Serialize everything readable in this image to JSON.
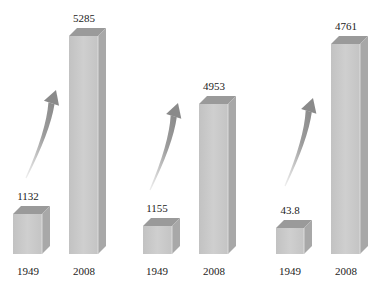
{
  "chart_data": {
    "type": "bar",
    "style": "3d-grouped-columns-with-growth-arrows",
    "title": "",
    "xlabel": "",
    "ylabel": "",
    "grid": false,
    "legend": null,
    "categories": [
      "1949",
      "2008"
    ],
    "groups": [
      {
        "name": "group-1",
        "values": [
          1132,
          5285
        ]
      },
      {
        "name": "group-2",
        "values": [
          1155,
          4953
        ]
      },
      {
        "name": "group-3",
        "values": [
          43.8,
          4761
        ]
      }
    ],
    "value_labels": [
      [
        "1132",
        "5285"
      ],
      [
        "1155",
        "4953"
      ],
      [
        "43.8",
        "4761"
      ]
    ],
    "x_labels": [
      [
        "1949",
        "2008"
      ],
      [
        "1949",
        "2008"
      ],
      [
        "1949",
        "2008"
      ]
    ],
    "annotations": [
      "upward growth arrow between 1949 and 2008 bars in each group"
    ]
  },
  "colors": {
    "front": "#c8c8c8",
    "top": "#9a9a9a",
    "side": "#a8a8a8",
    "arrow": "#8a8a8a"
  },
  "geometry": {
    "baseline_y": 254,
    "groups": [
      {
        "small": {
          "x": 13,
          "w": 29,
          "top": 214
        },
        "tall": {
          "x": 69,
          "w": 29,
          "top": 36
        },
        "arrow": [
          [
            26,
            178
          ],
          [
            56,
            90
          ]
        ],
        "small_label_x": 28,
        "tall_label_x": 84
      },
      {
        "small": {
          "x": 143,
          "w": 29,
          "top": 226
        },
        "tall": {
          "x": 199,
          "w": 29,
          "top": 104
        },
        "arrow": [
          [
            150,
            190
          ],
          [
            178,
            103
          ]
        ],
        "small_label_x": 157,
        "tall_label_x": 214
      },
      {
        "small": {
          "x": 276,
          "w": 28,
          "top": 228
        },
        "tall": {
          "x": 331,
          "w": 29,
          "top": 44
        },
        "arrow": [
          [
            285,
            186
          ],
          [
            313,
            98
          ]
        ],
        "small_label_x": 290,
        "tall_label_x": 346
      }
    ],
    "depth": 8
  }
}
